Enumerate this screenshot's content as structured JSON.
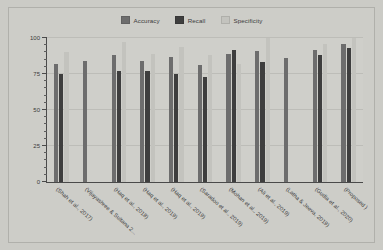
{
  "chart_data": {
    "type": "bar",
    "title": "",
    "subtitle": "",
    "xlabel": "",
    "ylabel": "",
    "ylim": [
      0,
      100
    ],
    "yticks": [
      0,
      25,
      50,
      75,
      100
    ],
    "ytick_labels": [
      "0",
      "25",
      "50",
      "75",
      "100"
    ],
    "grid": true,
    "legend_position": "top-center",
    "categories": [
      "(Shah et al., 2017)",
      "(Vijayashree & Sultana 2...",
      "(Haq et al., 2018)",
      "(Haq et al., 2019)",
      "(Haq et al., 2019)",
      "(Saradoo et al., 2019)",
      "(Mohan et al., 2019)",
      "(Ali et al., 2019)",
      "(Latha & Jeeva, 2019)",
      "(Gudla et al., 2020)",
      "(Proposed )"
    ],
    "series": [
      {
        "name": "Accuracy",
        "color": "#6d6d6d",
        "values": [
          82,
          84,
          88,
          84,
          87,
          81,
          89,
          91,
          86,
          92,
          96
        ]
      },
      {
        "name": "Recall",
        "color": "#3e3e3e",
        "values": [
          75,
          null,
          77,
          77,
          75,
          73,
          92,
          83,
          null,
          88,
          93
        ]
      },
      {
        "name": "Specificity",
        "color": "#c3c3be",
        "values": [
          90,
          null,
          97,
          89,
          94,
          88,
          82,
          100,
          null,
          96,
          100
        ]
      }
    ]
  },
  "legend": {
    "items": [
      {
        "label": "Accuracy",
        "color": "#6d6d6d"
      },
      {
        "label": "Recall",
        "color": "#3e3e3e"
      },
      {
        "label": "Specificity",
        "color": "#c3c3be"
      }
    ]
  },
  "figure": {
    "background": "#cbcbc6",
    "plot_background": "#cfcfca",
    "grid_color": "#bdbdb8",
    "axis_color": "#4a4a4a"
  }
}
